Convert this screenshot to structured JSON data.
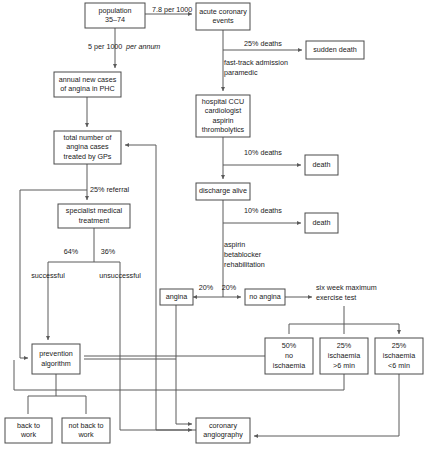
{
  "diagram": {
    "stroke_color": "#5a5a5a",
    "box_stroke_color": "#4a4a4a",
    "text_color": "#1a1a1a",
    "background": "#ffffff",
    "nodes": [
      {
        "id": "population",
        "lines": [
          "population",
          "35–74"
        ],
        "x": 85,
        "y": 3,
        "w": 60,
        "h": 25
      },
      {
        "id": "acute-coronary",
        "lines": [
          "acute coronary",
          "events"
        ],
        "x": 196,
        "y": 3,
        "w": 54,
        "h": 27
      },
      {
        "id": "sudden-death",
        "lines": [
          "sudden death"
        ],
        "x": 306,
        "y": 41,
        "w": 58,
        "h": 18
      },
      {
        "id": "annual-new-cases",
        "lines": [
          "annual new cases",
          "of angina in PHC"
        ],
        "x": 54,
        "y": 72,
        "w": 67,
        "h": 25
      },
      {
        "id": "hospital-ccu",
        "lines": [
          "hospital CCU",
          "cardiologist",
          "aspirin",
          "thrombolytics"
        ],
        "x": 196,
        "y": 95,
        "w": 54,
        "h": 42
      },
      {
        "id": "total-angina",
        "lines": [
          "total number of",
          "angina cases",
          "treated by GPs"
        ],
        "x": 54,
        "y": 131,
        "w": 67,
        "h": 33
      },
      {
        "id": "death-1",
        "lines": [
          "death"
        ],
        "x": 305,
        "y": 155,
        "w": 33,
        "h": 20
      },
      {
        "id": "discharge-alive",
        "lines": [
          "discharge alive"
        ],
        "x": 196,
        "y": 183,
        "w": 54,
        "h": 17
      },
      {
        "id": "specialist",
        "lines": [
          "specialist medical",
          "treatment"
        ],
        "x": 58,
        "y": 204,
        "w": 72,
        "h": 24
      },
      {
        "id": "death-2",
        "lines": [
          "death"
        ],
        "x": 305,
        "y": 213,
        "w": 33,
        "h": 20
      },
      {
        "id": "angina",
        "lines": [
          "angina"
        ],
        "x": 160,
        "y": 289,
        "w": 33,
        "h": 16
      },
      {
        "id": "no-angina",
        "lines": [
          "no angina"
        ],
        "x": 245,
        "y": 289,
        "w": 40,
        "h": 16
      },
      {
        "id": "prevention",
        "lines": [
          "prevention",
          "algorithm"
        ],
        "x": 32,
        "y": 344,
        "w": 48,
        "h": 30
      },
      {
        "id": "no-ischaemia-50",
        "lines": [
          "50%",
          "no",
          "ischaemia"
        ],
        "x": 265,
        "y": 338,
        "w": 48,
        "h": 36
      },
      {
        "id": "ischaemia-gt6",
        "lines": [
          "25%",
          "ischaemia",
          ">6 min"
        ],
        "x": 320,
        "y": 338,
        "w": 48,
        "h": 36
      },
      {
        "id": "ischaemia-lt6",
        "lines": [
          "25%",
          "ischaemia",
          "<6 min"
        ],
        "x": 375,
        "y": 338,
        "w": 48,
        "h": 36
      },
      {
        "id": "back-to-work",
        "lines": [
          "back to",
          "work"
        ],
        "x": 5,
        "y": 418,
        "w": 47,
        "h": 25
      },
      {
        "id": "not-back-to-work",
        "lines": [
          "not back to",
          "work"
        ],
        "x": 62,
        "y": 418,
        "w": 48,
        "h": 25
      },
      {
        "id": "coronary-angio",
        "lines": [
          "coronary",
          "angiography"
        ],
        "x": 196,
        "y": 418,
        "w": 54,
        "h": 25
      }
    ],
    "edge_labels": [
      {
        "id": "rate-78",
        "text": "7.8 per 1000",
        "x": 152,
        "y": 10,
        "anchor": "start",
        "italic": false
      },
      {
        "id": "rate-5",
        "text": "5 per 1000 ",
        "x": 88,
        "y": 47,
        "anchor": "start",
        "italic": false
      },
      {
        "id": "rate-5-annum",
        "text": "per annum",
        "x": 126,
        "y": 47,
        "anchor": "start",
        "italic": true
      },
      {
        "id": "deaths-25-sudden",
        "text": "25% deaths",
        "x": 244,
        "y": 44,
        "anchor": "start",
        "italic": false
      },
      {
        "id": "fast-track",
        "text": "fast-track admission",
        "x": 224,
        "y": 63,
        "anchor": "start",
        "italic": false
      },
      {
        "id": "paramedic",
        "text": "paramedic",
        "x": 224,
        "y": 73,
        "anchor": "start",
        "italic": false
      },
      {
        "id": "deaths-10-ccu",
        "text": "10% deaths",
        "x": 244,
        "y": 153,
        "anchor": "start",
        "italic": false
      },
      {
        "id": "deaths-10-discharge",
        "text": "10% deaths",
        "x": 244,
        "y": 211,
        "anchor": "start",
        "italic": false
      },
      {
        "id": "referral-25",
        "text": "25% referral",
        "x": 90,
        "y": 190,
        "anchor": "start",
        "italic": false
      },
      {
        "id": "aspirin-2",
        "text": "aspirin",
        "x": 224,
        "y": 245,
        "anchor": "start",
        "italic": false
      },
      {
        "id": "betablocker",
        "text": "betablocker",
        "x": 224,
        "y": 255,
        "anchor": "start",
        "italic": false
      },
      {
        "id": "rehabilitation",
        "text": "rehabilitation",
        "x": 224,
        "y": 265,
        "anchor": "start",
        "italic": false
      },
      {
        "id": "pct-64",
        "text": "64%",
        "x": 71,
        "y": 252,
        "anchor": "middle",
        "italic": false
      },
      {
        "id": "pct-36",
        "text": "36%",
        "x": 108,
        "y": 252,
        "anchor": "middle",
        "italic": false
      },
      {
        "id": "successful",
        "text": "successful",
        "x": 48,
        "y": 276,
        "anchor": "middle",
        "italic": false
      },
      {
        "id": "unsuccessful",
        "text": "unsuccessful",
        "x": 120,
        "y": 276,
        "anchor": "middle",
        "italic": false
      },
      {
        "id": "pct-20-left",
        "text": "20%",
        "x": 206,
        "y": 288,
        "anchor": "middle",
        "italic": false
      },
      {
        "id": "pct-20-right",
        "text": "20%",
        "x": 229,
        "y": 288,
        "anchor": "middle",
        "italic": false
      },
      {
        "id": "exercise-test-1",
        "text": "six week maximum",
        "x": 316,
        "y": 288,
        "anchor": "start",
        "italic": false
      },
      {
        "id": "exercise-test-2",
        "text": "exercise test",
        "x": 316,
        "y": 298,
        "anchor": "start",
        "italic": false
      }
    ],
    "edges": [
      {
        "id": "population-to-acute",
        "d": "M145,14 L192,14",
        "arrow": true
      },
      {
        "id": "acute-to-sudden-death",
        "d": "M223,30 L223,50 L302,50",
        "arrow": true
      },
      {
        "id": "acute-to-ccu",
        "d": "M223,50 L223,91",
        "arrow": true
      },
      {
        "id": "population-to-annual",
        "d": "M115,28 L115,68",
        "arrow": true
      },
      {
        "id": "annual-to-total",
        "d": "M87,97 L87,127",
        "arrow": true
      },
      {
        "id": "ccu-to-death1",
        "d": "M223,137 L223,165 L301,165",
        "arrow": true
      },
      {
        "id": "ccu-to-discharge",
        "d": "M223,165 L223,179",
        "arrow": true
      },
      {
        "id": "discharge-to-death2",
        "d": "M223,200 L223,223 L301,223",
        "arrow": true
      },
      {
        "id": "discharge-to-split",
        "d": "M223,223 L223,297 L193,297",
        "arrow": true
      },
      {
        "id": "split-to-no-angina",
        "d": "M223,297 L241,297",
        "arrow": true
      },
      {
        "id": "total-to-specialist",
        "d": "M87,164 L87,200",
        "arrow": true
      },
      {
        "id": "total-bypass-left",
        "d": "M87,190 L20,190 L20,358 L28,358",
        "arrow": true
      },
      {
        "id": "specialist-split",
        "d": "M94,228 L94,262 M48,262 L120,262 M48,262 L48,290 M120,262 L120,290",
        "arrow": false
      },
      {
        "id": "successful-to-prevention",
        "d": "M48,290 L48,340",
        "arrow": true
      },
      {
        "id": "unsuccessful-down",
        "d": "M120,290 L120,430 L192,430",
        "arrow": true
      },
      {
        "id": "angina-to-prevention",
        "d": "M176,305 L176,359 L84,359",
        "arrow": false
      },
      {
        "id": "prevention-split",
        "d": "M56,374 L56,396 M28,396 L86,396 M28,396 L28,414 M86,396 L86,414",
        "arrow": false
      },
      {
        "id": "no-angina-to-test",
        "d": "M285,297 L312,297",
        "arrow": true
      },
      {
        "id": "test-to-boxes",
        "d": "M344,306 L344,324 M289,324 L399,324 M289,324 L289,334 M344,324 L344,334 M399,324 L399,334",
        "arrow": true
      },
      {
        "id": "ischaemia50-to-prevention",
        "d": "M265,356 L84,356",
        "arrow": false
      },
      {
        "id": "ischaemia-gt6-down",
        "d": "M344,374 L344,390 L14,390 L14,360",
        "arrow": false
      },
      {
        "id": "ischaemia-lt6-to-angio",
        "d": "M399,374 L399,436 L254,436",
        "arrow": true
      },
      {
        "id": "angio-to-total",
        "d": "M250,430 L156,430 L156,145 L125,145",
        "arrow": true
      },
      {
        "id": "angina-to-angio",
        "d": "M176,359 L176,424 L192,424",
        "arrow": true
      }
    ]
  }
}
